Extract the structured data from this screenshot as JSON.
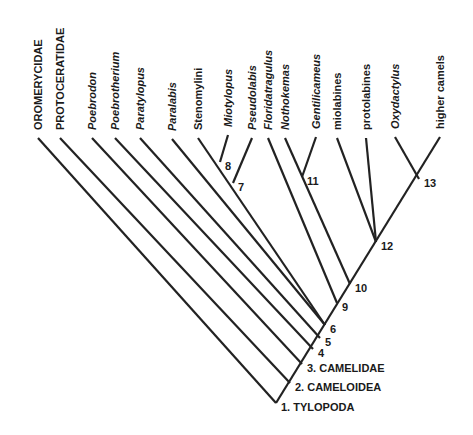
{
  "diagram": {
    "type": "cladogram",
    "taxa": [
      {
        "label": "OROMERYCIDAE",
        "style": "caps",
        "x": 38,
        "tipY": 138
      },
      {
        "label": "PROTOCERATIDAE",
        "style": "caps",
        "x": 60,
        "tipY": 138
      },
      {
        "label": "Poebrodon",
        "style": "italic",
        "x": 92,
        "tipY": 138
      },
      {
        "label": "Poebrotherium",
        "style": "italic",
        "x": 115,
        "tipY": 138
      },
      {
        "label": "Paratylopus",
        "style": "italic",
        "x": 140,
        "tipY": 138
      },
      {
        "label": "Paralabis",
        "style": "italic",
        "x": 172,
        "tipY": 139
      },
      {
        "label": "Stenomylini",
        "style": "roman",
        "x": 198,
        "tipY": 138
      },
      {
        "label": "Miotylopus",
        "style": "italic",
        "x": 228,
        "tipY": 135
      },
      {
        "label": "Pseudolabis",
        "style": "italic",
        "x": 252,
        "tipY": 138
      },
      {
        "label": "Floridatragulus",
        "style": "italic",
        "x": 268,
        "tipY": 138
      },
      {
        "label": "Nothokemas",
        "style": "italic",
        "x": 285,
        "tipY": 138
      },
      {
        "label": "Gentilicameus",
        "style": "italic",
        "x": 316,
        "tipY": 137
      },
      {
        "label": "miolabines",
        "style": "roman",
        "x": 337,
        "tipY": 138
      },
      {
        "label": "protolabines",
        "style": "roman",
        "x": 366,
        "tipY": 138
      },
      {
        "label": "Oxydactylus",
        "style": "italic",
        "x": 395,
        "tipY": 137
      },
      {
        "label": "higher camels",
        "style": "roman",
        "x": 440,
        "tipY": 137
      }
    ],
    "nodes": [
      {
        "id": "1",
        "label": "1. TYLOPODA",
        "x": 276,
        "y": 403
      },
      {
        "id": "2",
        "label": "2. CAMELOIDEA",
        "x": 290,
        "y": 383
      },
      {
        "id": "3",
        "label": "3. CAMELIDAE",
        "x": 302,
        "y": 364
      },
      {
        "id": "4",
        "label": "4",
        "x": 313,
        "y": 349
      },
      {
        "id": "5",
        "label": "5",
        "x": 320,
        "y": 338
      },
      {
        "id": "6",
        "label": "6",
        "x": 325,
        "y": 325
      },
      {
        "id": "7",
        "label": "7",
        "x": 233,
        "y": 183
      },
      {
        "id": "8",
        "label": "8",
        "x": 220,
        "y": 162
      },
      {
        "id": "9",
        "label": "9",
        "x": 337,
        "y": 303
      },
      {
        "id": "10",
        "label": "10",
        "x": 350,
        "y": 284
      },
      {
        "id": "11",
        "label": "11",
        "x": 302,
        "y": 177
      },
      {
        "id": "12",
        "label": "12",
        "x": 376,
        "y": 242
      },
      {
        "id": "13",
        "label": "13",
        "x": 419,
        "y": 179
      }
    ]
  }
}
